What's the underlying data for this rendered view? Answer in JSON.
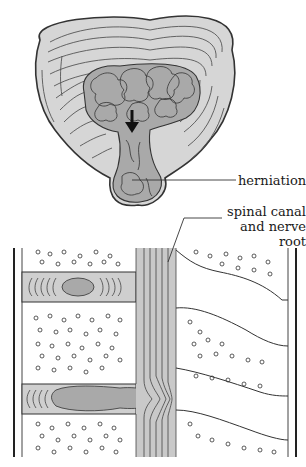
{
  "figure": {
    "caption_cut": "",
    "top_view": {
      "name": "intervertebral disc (axial view)",
      "arrow_direction": "down"
    },
    "side_view": {
      "name": "lumbar spine (sagittal view)"
    },
    "labels": {
      "herniation": "herniation",
      "spinal_canal_line1": "spinal canal",
      "spinal_canal_line2": "and nerve root"
    },
    "colors": {
      "annulus_fill": "#d6d6d6",
      "nucleus_fill": "#a9a9a9",
      "line": "#333333",
      "bone_fill": "#ffffff",
      "canal_fill": "#c9c9c9"
    }
  }
}
